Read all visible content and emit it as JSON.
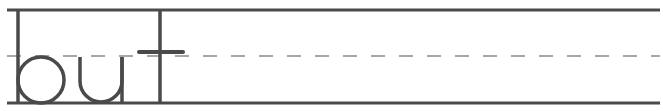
{
  "worksheet": {
    "word": "but",
    "letters": [
      "b",
      "u",
      "t"
    ],
    "guide_lines": {
      "top": "solid",
      "middle": "dashed",
      "baseline": "solid"
    },
    "colors": {
      "line": "#4a4a4a",
      "dash": "#8a8a8a",
      "letter": "#4a4a4a",
      "background": "#ffffff"
    }
  }
}
